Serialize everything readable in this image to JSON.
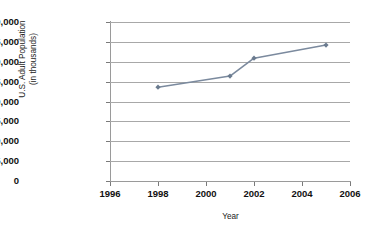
{
  "chart_data": {
    "type": "line",
    "title": "",
    "xlabel": "Year",
    "ylabel": "U.S. Adult Population (in thousands)",
    "ylabel_line1": "U.S. Adult Population",
    "ylabel_line2": "(in thousands)",
    "x": [
      1998,
      2001,
      2002,
      2005
    ],
    "values": [
      23600,
      26400,
      30900,
      34200
    ],
    "series": [
      {
        "name": "U.S. Adult Population",
        "points": [
          {
            "x": 1998,
            "y": 23600
          },
          {
            "x": 2001,
            "y": 26400
          },
          {
            "x": 2002,
            "y": 30900
          },
          {
            "x": 2005,
            "y": 34200
          }
        ]
      }
    ],
    "xlim": [
      1996,
      2006
    ],
    "ylim": [
      0,
      40000
    ],
    "xticks": [
      "1996",
      "1998",
      "2000",
      "2002",
      "2004",
      "2006"
    ],
    "xtick_values": [
      1996,
      1998,
      2000,
      2002,
      2004,
      2006
    ],
    "yticks": [
      "0",
      "5,000",
      "10,000",
      "15,000",
      "20,000",
      "25,000",
      "30,000",
      "35,000",
      "40,000"
    ],
    "ytick_values": [
      0,
      5000,
      10000,
      15000,
      20000,
      25000,
      30000,
      35000,
      40000
    ],
    "grid": "horizontal",
    "legend": "none",
    "colors": {
      "line": "#7b8a9e",
      "marker": "#6b7b8f",
      "grid": "#a8a8a8",
      "axis": "#9a9a9a",
      "text": "#111111",
      "background": "#ffffff"
    }
  }
}
